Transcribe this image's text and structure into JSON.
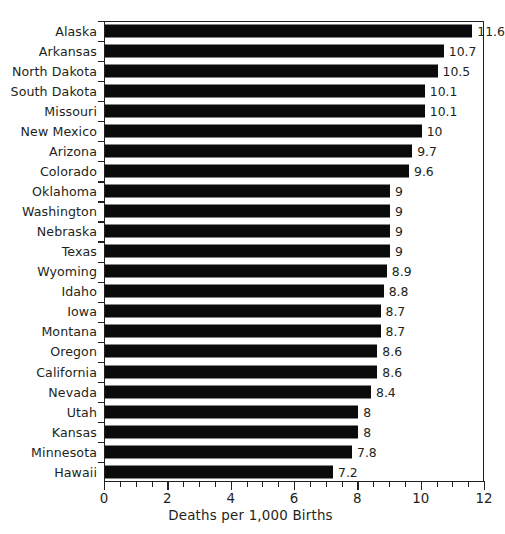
{
  "chart_data": {
    "type": "bar",
    "orientation": "horizontal",
    "title": "",
    "xlabel": "Deaths per 1,000 Births",
    "ylabel": "",
    "xlim": [
      0,
      12
    ],
    "xticks": [
      0,
      2,
      4,
      6,
      8,
      10,
      12
    ],
    "xtick_labels": [
      "0",
      "2",
      "4",
      "6",
      "8",
      "10",
      "12"
    ],
    "minor_tick_step": 0.5,
    "grid": false,
    "legend": null,
    "bar_color": "#0b0b0b",
    "categories": [
      "Alaska",
      "Arkansas",
      "North Dakota",
      "South Dakota",
      "Missouri",
      "New Mexico",
      "Arizona",
      "Colorado",
      "Oklahoma",
      "Washington",
      "Nebraska",
      "Texas",
      "Wyoming",
      "Idaho",
      "Iowa",
      "Montana",
      "Oregon",
      "California",
      "Nevada",
      "Utah",
      "Kansas",
      "Minnesota",
      "Hawaii"
    ],
    "values": [
      11.6,
      10.7,
      10.5,
      10.1,
      10.1,
      10,
      9.7,
      9.6,
      9,
      9,
      9,
      9,
      8.9,
      8.8,
      8.7,
      8.7,
      8.6,
      8.6,
      8.4,
      8,
      8,
      7.8,
      7.2
    ],
    "data_labels": [
      "11.6",
      "10.7",
      "10.5",
      "10.1",
      "10.1",
      "10",
      "9.7",
      "9.6",
      "9",
      "9",
      "9",
      "9",
      "8.9",
      "8.8",
      "8.7",
      "8.7",
      "8.6",
      "8.6",
      "8.4",
      "8",
      "8",
      "7.8",
      "7.2"
    ]
  },
  "figure": {
    "title_remnant": "",
    "background_color": "#ffffff",
    "axis_color": "#231f20",
    "text_color": "#231f20"
  }
}
